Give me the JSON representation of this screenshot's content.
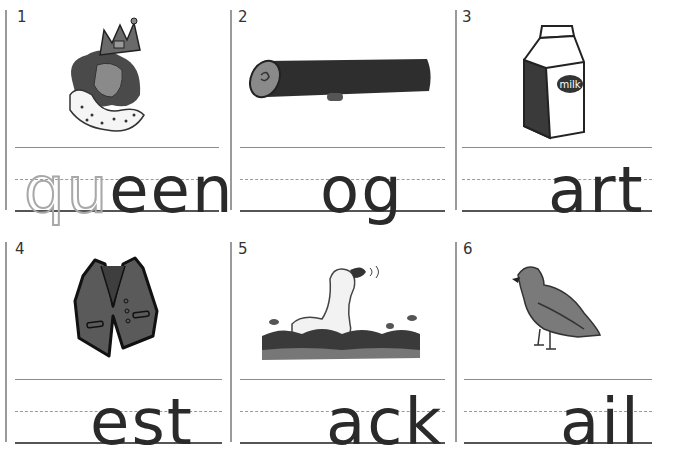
{
  "worksheet": {
    "cells": [
      {
        "number": "1",
        "picture": "queen",
        "traced_letters": "qu",
        "word_ending": "een"
      },
      {
        "number": "2",
        "picture": "log",
        "traced_letters": "",
        "word_ending": "og"
      },
      {
        "number": "3",
        "picture": "milk carton",
        "traced_letters": "",
        "word_ending": "art",
        "label_on_picture": "milk"
      },
      {
        "number": "4",
        "picture": "vest",
        "traced_letters": "",
        "word_ending": "est"
      },
      {
        "number": "5",
        "picture": "duck",
        "traced_letters": "",
        "word_ending": "ack"
      },
      {
        "number": "6",
        "picture": "quail",
        "traced_letters": "",
        "word_ending": "ail"
      }
    ]
  },
  "colors": {
    "text": "#2a2a2a",
    "traced": "#a8a8a8",
    "rule": "#8c8c8c",
    "picture_dark": "#3a3a3a",
    "picture_mid": "#777777"
  }
}
